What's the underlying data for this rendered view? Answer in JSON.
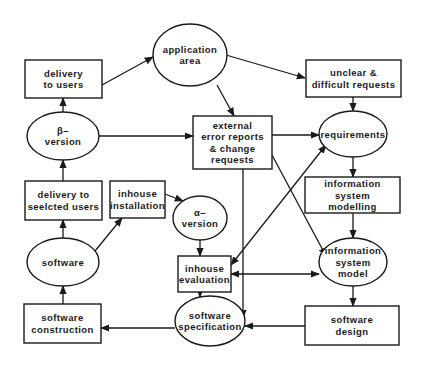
{
  "diagram": {
    "type": "flow-cycle",
    "colors": {
      "stroke": "#1a1a1a",
      "fill": "#ffffff",
      "text": "#1a1a1a"
    },
    "nodes": [
      {
        "id": "application_area",
        "shape": "ellipse",
        "lines": [
          "application",
          "area"
        ],
        "cx": 190,
        "cy": 55,
        "rx": 37,
        "ry": 31
      },
      {
        "id": "delivery_to_users",
        "shape": "rect",
        "lines": [
          "delivery",
          "to users"
        ],
        "x": 25,
        "y": 60,
        "w": 77,
        "h": 38
      },
      {
        "id": "unclear_requests",
        "shape": "rect",
        "lines": [
          "unclear &",
          "difficult requests"
        ],
        "x": 306,
        "y": 60,
        "w": 95,
        "h": 37
      },
      {
        "id": "beta_version",
        "shape": "ellipse",
        "lines": [
          "β–",
          "version"
        ],
        "cx": 63,
        "cy": 136,
        "rx": 36,
        "ry": 24
      },
      {
        "id": "external_error_reports",
        "shape": "rect",
        "lines": [
          "external",
          "error reports",
          "& change",
          "requests"
        ],
        "x": 193,
        "y": 116,
        "w": 79,
        "h": 53
      },
      {
        "id": "requirements",
        "shape": "ellipse",
        "lines": [
          "requirements"
        ],
        "cx": 353,
        "cy": 134,
        "rx": 34,
        "ry": 23
      },
      {
        "id": "delivery_to_selected_users",
        "shape": "rect",
        "lines": [
          "delivery to",
          "seelcted users"
        ],
        "x": 25,
        "y": 181,
        "w": 77,
        "h": 39
      },
      {
        "id": "inhouse_installation",
        "shape": "rect",
        "lines": [
          "inhouse",
          "installation"
        ],
        "x": 110,
        "y": 181,
        "w": 55,
        "h": 37
      },
      {
        "id": "alpha_version",
        "shape": "ellipse",
        "lines": [
          "α–",
          "version"
        ],
        "cx": 200,
        "cy": 218,
        "rx": 27,
        "ry": 22
      },
      {
        "id": "information_system_modelling",
        "shape": "rect",
        "lines": [
          "information",
          "system",
          "modelling"
        ],
        "x": 305,
        "y": 177,
        "w": 95,
        "h": 36
      },
      {
        "id": "software",
        "shape": "ellipse",
        "lines": [
          "software"
        ],
        "cx": 63,
        "cy": 262,
        "rx": 36,
        "ry": 24
      },
      {
        "id": "inhouse_evaluation",
        "shape": "rect",
        "lines": [
          "inhouse",
          "evaluation"
        ],
        "x": 178,
        "y": 256,
        "w": 53,
        "h": 36
      },
      {
        "id": "information_system_model",
        "shape": "ellipse",
        "lines": [
          "information",
          "system",
          "model"
        ],
        "cx": 353,
        "cy": 262,
        "rx": 34,
        "ry": 24
      },
      {
        "id": "software_construction",
        "shape": "rect",
        "lines": [
          "software",
          "construction"
        ],
        "x": 24,
        "y": 304,
        "w": 77,
        "h": 39
      },
      {
        "id": "software_specification",
        "shape": "ellipse",
        "lines": [
          "software",
          "specification"
        ],
        "cx": 210,
        "cy": 321,
        "rx": 35,
        "ry": 25
      },
      {
        "id": "software_design",
        "shape": "rect",
        "lines": [
          "software",
          "design"
        ],
        "x": 305,
        "y": 306,
        "w": 94,
        "h": 39
      }
    ],
    "edges": [
      {
        "from": "delivery_to_users",
        "to": "application_area",
        "points": [
          [
            102,
            85
          ],
          [
            153,
            57
          ]
        ],
        "arrow": "end"
      },
      {
        "from": "application_area",
        "to": "unclear_requests",
        "points": [
          [
            226,
            55
          ],
          [
            305,
            78
          ]
        ],
        "arrow": "end"
      },
      {
        "from": "application_area",
        "to": "external_error_reports",
        "points": [
          [
            217,
            85
          ],
          [
            234,
            116
          ]
        ],
        "arrow": "end"
      },
      {
        "from": "beta_version",
        "to": "delivery_to_users",
        "points": [
          [
            63,
            112
          ],
          [
            63,
            98
          ]
        ],
        "arrow": "end"
      },
      {
        "from": "beta_version",
        "to": "external_error_reports",
        "points": [
          [
            99,
            136
          ],
          [
            193,
            136
          ]
        ],
        "arrow": "end"
      },
      {
        "from": "unclear_requests",
        "to": "requirements",
        "points": [
          [
            353,
            97
          ],
          [
            353,
            111
          ]
        ],
        "arrow": "end"
      },
      {
        "from": "external_error_reports",
        "to": "requirements",
        "points": [
          [
            272,
            135
          ],
          [
            319,
            135
          ]
        ],
        "arrow": "end"
      },
      {
        "from": "external_error_reports",
        "to": "information_system_model",
        "points": [
          [
            272,
            155
          ],
          [
            326,
            256
          ]
        ],
        "arrow": "end"
      },
      {
        "from": "external_error_reports",
        "to": "software_specification",
        "points": [
          [
            243,
            169
          ],
          [
            243,
            318
          ]
        ],
        "arrow": "end"
      },
      {
        "from": "inhouse_evaluation",
        "to": "requirements",
        "points": [
          [
            231,
            265
          ],
          [
            326,
            145
          ]
        ],
        "arrow": "both"
      },
      {
        "from": "delivery_to_selected_users",
        "to": "beta_version",
        "points": [
          [
            63,
            181
          ],
          [
            63,
            160
          ]
        ],
        "arrow": "end"
      },
      {
        "from": "inhouse_installation",
        "to": "alpha_version",
        "points": [
          [
            165,
            194
          ],
          [
            183,
            201
          ]
        ],
        "arrow": "end"
      },
      {
        "from": "requirements",
        "to": "information_system_modelling",
        "points": [
          [
            353,
            157
          ],
          [
            353,
            177
          ]
        ],
        "arrow": "end"
      },
      {
        "from": "software",
        "to": "delivery_to_selected_users",
        "points": [
          [
            63,
            238
          ],
          [
            63,
            220
          ]
        ],
        "arrow": "end"
      },
      {
        "from": "software",
        "to": "inhouse_installation",
        "points": [
          [
            95,
            251
          ],
          [
            122,
            218
          ]
        ],
        "arrow": "end"
      },
      {
        "from": "alpha_version",
        "to": "inhouse_evaluation",
        "points": [
          [
            200,
            240
          ],
          [
            200,
            256
          ]
        ],
        "arrow": "end"
      },
      {
        "from": "information_system_modelling",
        "to": "information_system_model",
        "points": [
          [
            353,
            213
          ],
          [
            353,
            238
          ]
        ],
        "arrow": "end"
      },
      {
        "from": "inhouse_evaluation",
        "to": "information_system_model",
        "points": [
          [
            231,
            274
          ],
          [
            319,
            274
          ]
        ],
        "arrow": "both"
      },
      {
        "from": "inhouse_evaluation",
        "to": "software_specification",
        "points": [
          [
            200,
            292
          ],
          [
            200,
            297
          ]
        ],
        "arrow": "end"
      },
      {
        "from": "information_system_model",
        "to": "software_design",
        "points": [
          [
            353,
            286
          ],
          [
            353,
            306
          ]
        ],
        "arrow": "end"
      },
      {
        "from": "software_construction",
        "to": "software",
        "points": [
          [
            63,
            304
          ],
          [
            63,
            286
          ]
        ],
        "arrow": "end"
      },
      {
        "from": "software_specification",
        "to": "software_construction",
        "points": [
          [
            175,
            328
          ],
          [
            101,
            328
          ]
        ],
        "arrow": "end"
      },
      {
        "from": "software_design",
        "to": "software_specification",
        "points": [
          [
            305,
            326
          ],
          [
            245,
            326
          ]
        ],
        "arrow": "end"
      }
    ]
  }
}
